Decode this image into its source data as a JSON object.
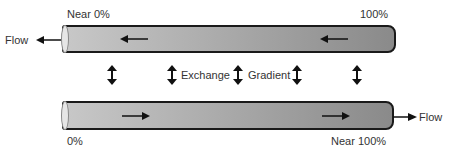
{
  "diagram": {
    "top_tube": {
      "left_label": "Near 0%",
      "right_label": "100%",
      "flow_label": "Flow",
      "flow_direction": "left"
    },
    "bottom_tube": {
      "left_label": "0%",
      "right_label": "Near 100%",
      "flow_label": "Flow",
      "flow_direction": "right"
    },
    "middle": {
      "exchange_label": "Exchange",
      "gradient_label": "Gradient",
      "double_arrow_count": 5
    },
    "colors": {
      "tube_light": "#c8c8c8",
      "tube_dark": "#8a8a8a",
      "outline": "#1a1a1a"
    }
  }
}
